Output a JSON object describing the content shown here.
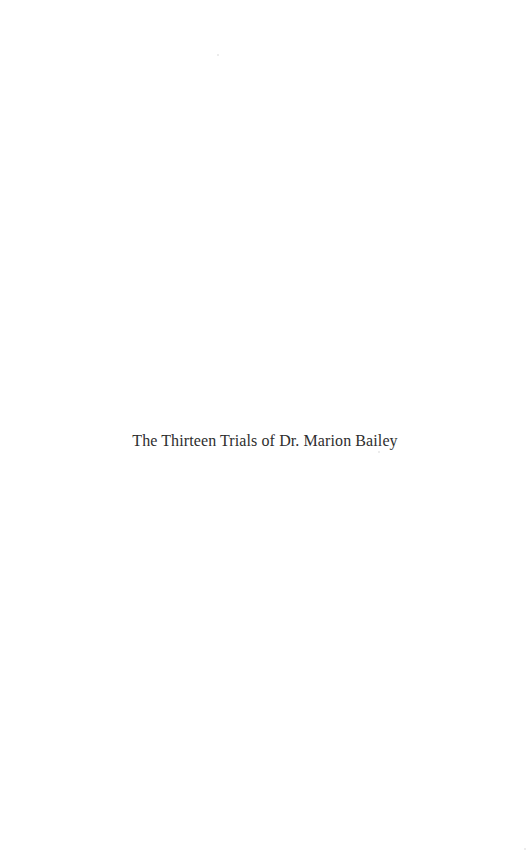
{
  "page": {
    "title": "The Thirteen Trials of Dr. Marion Bailey",
    "text_color": "#2e2e2e",
    "background": "#ffffff"
  }
}
